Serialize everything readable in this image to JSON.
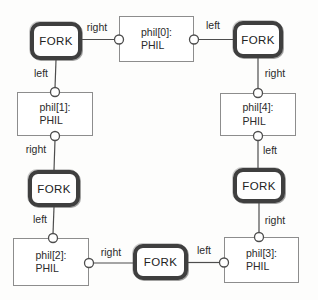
{
  "diagram": {
    "kind": "dining-philosophers-structure-diagram",
    "colors": {
      "fork_border": "#3f3f3f",
      "phil_border": "#8d8d8d",
      "wire": "#4d4d4d",
      "text": "#2b2b2b",
      "background": "#fdfdfc"
    },
    "forks": {
      "top_left": {
        "label": "FORK"
      },
      "top_right": {
        "label": "FORK"
      },
      "mid_left": {
        "label": "FORK"
      },
      "mid_right": {
        "label": "FORK"
      },
      "bottom": {
        "label": "FORK"
      }
    },
    "phils": {
      "phil0": {
        "name": "phil[0]:",
        "type": "PHIL"
      },
      "phil1": {
        "name": "phil[1]:",
        "type": "PHIL"
      },
      "phil2": {
        "name": "phil[2]:",
        "type": "PHIL"
      },
      "phil3": {
        "name": "phil[3]:",
        "type": "PHIL"
      },
      "phil4": {
        "name": "phil[4]:",
        "type": "PHIL"
      }
    },
    "edges": {
      "tl_fork_to_phil0": "right",
      "phil0_to_tr_fork": "left",
      "tl_fork_to_phil1": "left",
      "tr_fork_to_phil4": "right",
      "phil1_to_ml_fork": "right",
      "phil4_to_mr_fork": "left",
      "ml_fork_to_phil2": "left",
      "mr_fork_to_phil3": "right",
      "phil2_to_b_fork": "right",
      "b_fork_to_phil3": "left"
    }
  }
}
